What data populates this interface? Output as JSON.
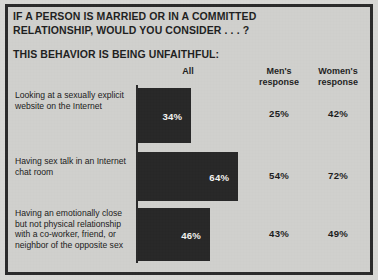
{
  "title": {
    "line1": "IF A PERSON IS MARRIED OR IN A COMMITTED",
    "line2": "RELATIONSHIP, WOULD YOU CONSIDER . . . ?",
    "subtitle": "THIS BEHAVIOR IS BEING UNFAITHFUL:"
  },
  "headers": {
    "all": "All",
    "men": "Men's\nresponse",
    "men_line1": "Men's",
    "men_line2": "response",
    "women_line1": "Women's",
    "women_line2": "response"
  },
  "colors": {
    "background": "#d0d0cd",
    "frame": "#2b2b2b",
    "bar": "#282828",
    "bar_label": "#f3f3f0",
    "text": "#1f1f1f"
  },
  "rows": [
    {
      "label": "Looking at a sexually explicit website on the Internet",
      "all": "34%",
      "men": "25%",
      "women": "42%"
    },
    {
      "label": "Having sex talk in an Internet chat room",
      "all": "64%",
      "men": "54%",
      "women": "72%"
    },
    {
      "label": "Having an emotionally close but not physical relationship with a co-worker, friend, or neighbor of the opposite sex",
      "all": "46%",
      "men": "43%",
      "women": "49%"
    }
  ],
  "chart_data": {
    "type": "bar",
    "title": "IF A PERSON IS MARRIED OR IN A COMMITTED RELATIONSHIP, WOULD YOU CONSIDER . . . ? THIS BEHAVIOR IS BEING UNFAITHFUL:",
    "xlabel": "",
    "ylabel": "",
    "orientation": "horizontal",
    "grid": false,
    "legend": "none",
    "xlim": [
      0,
      100
    ],
    "categories": [
      "Looking at a sexually explicit website on the Internet",
      "Having sex talk in an Internet chat room",
      "Having an emotionally close but not physical relationship with a co-worker, friend, or neighbor of the opposite sex"
    ],
    "series": [
      {
        "name": "All",
        "values": [
          34,
          64,
          46
        ],
        "plotted": true
      },
      {
        "name": "Men's response",
        "values": [
          25,
          54,
          43
        ],
        "plotted": false
      },
      {
        "name": "Women's response",
        "values": [
          42,
          72,
          49
        ],
        "plotted": false
      }
    ],
    "units": "percent"
  }
}
